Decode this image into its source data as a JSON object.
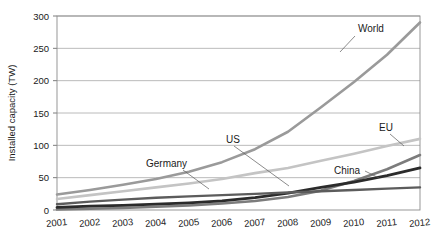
{
  "chart_data": {
    "type": "line",
    "title": "",
    "xlabel": "",
    "ylabel": "Installed capacity (TW)",
    "x": [
      2001,
      2002,
      2003,
      2004,
      2005,
      2006,
      2007,
      2008,
      2009,
      2010,
      2011,
      2012
    ],
    "categories": [
      "2001",
      "2002",
      "2003",
      "2004",
      "2005",
      "2006",
      "2007",
      "2008",
      "2009",
      "2010",
      "2011",
      "2012"
    ],
    "xlim": [
      2001,
      2012
    ],
    "ylim": [
      0,
      300
    ],
    "yticks": [
      0,
      50,
      100,
      150,
      200,
      250,
      300
    ],
    "ytick_labels": [
      "0",
      "50",
      "100",
      "150",
      "200",
      "250",
      "300"
    ],
    "grid": "horizontal",
    "legend": "none (inline annotations with leader lines)",
    "series": [
      {
        "name": "World",
        "color": "#9a9a9a",
        "values": [
          24,
          31,
          39,
          48,
          59,
          74,
          94,
          121,
          159,
          198,
          240,
          290
        ]
      },
      {
        "name": "EU",
        "color": "#c4c4c4",
        "values": [
          17,
          23,
          29,
          35,
          41,
          48,
          57,
          65,
          76,
          87,
          99,
          110
        ]
      },
      {
        "name": "China",
        "color": "#7c7c7c",
        "values": [
          1,
          2,
          3,
          5,
          7,
          10,
          14,
          20,
          30,
          45,
          63,
          85
        ]
      },
      {
        "name": "US",
        "color": "#2b2b2b",
        "values": [
          4,
          6,
          7,
          9,
          11,
          14,
          19,
          26,
          35,
          43,
          53,
          65
        ]
      },
      {
        "name": "Germany",
        "color": "#5c5c5c",
        "values": [
          9,
          13,
          16,
          19,
          21,
          23,
          25,
          27,
          29,
          31,
          33,
          35
        ]
      }
    ],
    "annotations": [
      {
        "label": "World",
        "x": 358,
        "y": 32,
        "leader": "M 355 36 L 340 52"
      },
      {
        "label": "EU",
        "x": 379,
        "y": 131,
        "leader": "M 390 134 L 404 146"
      },
      {
        "label": "China",
        "x": 334,
        "y": 174,
        "leader": "M 365 171 L 379 178"
      },
      {
        "label": "US",
        "x": 226,
        "y": 143,
        "leader": "M 234 146 L 289 186"
      },
      {
        "label": "Germany",
        "x": 146,
        "y": 167,
        "leader": "M 183 170 L 209 189"
      }
    ]
  }
}
